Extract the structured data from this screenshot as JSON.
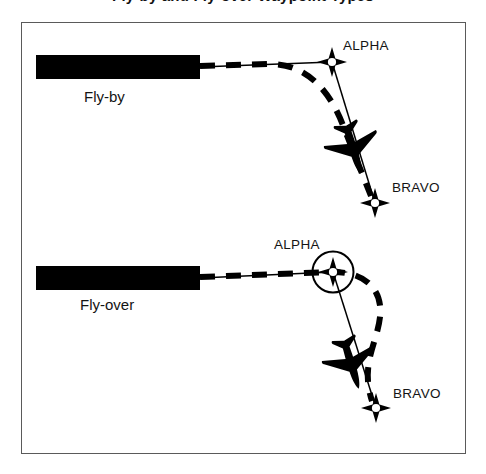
{
  "figure": {
    "title": "Fly-by and Fly-over Waypoint Types",
    "frame": {
      "x": 21,
      "y": 22,
      "width": 445,
      "height": 432,
      "border_color": "#5a5a5a",
      "background_color": "#ffffff"
    },
    "ink_color": "#000000",
    "text_color": "#141414"
  },
  "panels": [
    {
      "id": "fly-by",
      "mode_label": "Fly-by",
      "runway": {
        "x": 36,
        "y": 55,
        "width": 164,
        "height": 24,
        "color": "#000000"
      },
      "waypoints": [
        {
          "name": "ALPHA",
          "label": "ALPHA",
          "x": 332,
          "y": 62,
          "circled": false
        },
        {
          "name": "BRAVO",
          "label": "BRAVO",
          "x": 375,
          "y": 203,
          "circled": false
        }
      ],
      "aircraft": {
        "x": 352,
        "y": 145,
        "heading_deg": 163
      },
      "description": "Dashed track turns early and cuts inside the ALPHA waypoint without overflying it."
    },
    {
      "id": "fly-over",
      "mode_label": "Fly-over",
      "runway": {
        "x": 36,
        "y": 266,
        "width": 164,
        "height": 24,
        "color": "#000000"
      },
      "waypoints": [
        {
          "name": "ALPHA",
          "label": "ALPHA",
          "x": 333,
          "y": 272,
          "circled": true
        },
        {
          "name": "BRAVO",
          "label": "BRAVO",
          "x": 376,
          "y": 408,
          "circled": false
        }
      ],
      "aircraft": {
        "x": 350,
        "y": 360,
        "heading_deg": 163
      },
      "description": "Dashed track passes directly over the ALPHA waypoint, then overshoots and curves back onto the outbound leg."
    }
  ],
  "legend": {
    "solid_line": "Planned leg / desired track",
    "dashed_line": "Actual aircraft ground track",
    "star_symbol": "Waypoint",
    "circled_star_symbol": "Fly-over waypoint",
    "black_bar": "Runway"
  }
}
